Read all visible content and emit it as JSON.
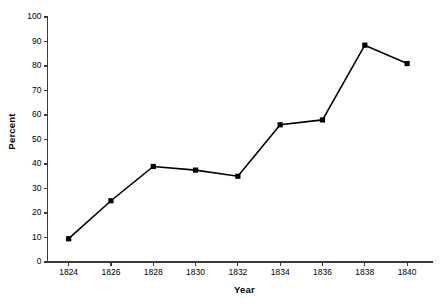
{
  "chart_data": {
    "type": "line",
    "title": "",
    "xlabel": "Year",
    "ylabel": "Percent",
    "x": [
      1824,
      1826,
      1828,
      1830,
      1832,
      1834,
      1836,
      1838,
      1840
    ],
    "values": [
      9.5,
      25,
      39,
      37.5,
      35,
      56,
      58,
      88.5,
      81
    ],
    "series": [
      {
        "name": "Percent",
        "values": [
          9.5,
          25,
          39,
          37.5,
          35,
          56,
          58,
          88.5,
          81
        ],
        "marker": "filled-square",
        "color": "#000000"
      }
    ],
    "xlim": [
      1823,
      1841.2
    ],
    "ylim": [
      0,
      100
    ],
    "xticks": [
      1824,
      1826,
      1828,
      1830,
      1832,
      1834,
      1836,
      1838,
      1840
    ],
    "xtick_labels": [
      "1824",
      "1826",
      "1828",
      "1830",
      "1832",
      "1834",
      "1836",
      "1838",
      "1840"
    ],
    "yticks": [
      0,
      10,
      20,
      30,
      40,
      50,
      60,
      70,
      80,
      90,
      100
    ],
    "ytick_labels": [
      "0",
      "10",
      "20",
      "30",
      "40",
      "50",
      "60",
      "70",
      "80",
      "90",
      "100"
    ],
    "grid": false,
    "legend": "none",
    "background_color": "#ffffff",
    "axis_color": "#3a3a3a"
  }
}
